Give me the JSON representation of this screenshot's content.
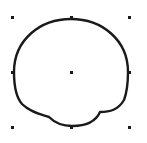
{
  "canvas": {
    "background": "#ffffff",
    "width": 147,
    "height": 143
  },
  "shape": {
    "kind": "scalloped-blob",
    "stroke": "#1a1a1a",
    "stroke_width": 2.4,
    "fill": "none",
    "selected": true
  },
  "selection": {
    "handle_color": "#1a1a1a",
    "bbox": {
      "left": 12,
      "top": 17,
      "right": 129,
      "bottom": 127
    },
    "handles": [
      {
        "name": "handle-top-left",
        "x": 12,
        "y": 17
      },
      {
        "name": "handle-top-middle",
        "x": 71,
        "y": 17
      },
      {
        "name": "handle-top-right",
        "x": 129,
        "y": 17
      },
      {
        "name": "handle-middle-left",
        "x": 12,
        "y": 72
      },
      {
        "name": "handle-center",
        "x": 71,
        "y": 72
      },
      {
        "name": "handle-middle-right",
        "x": 129,
        "y": 72
      },
      {
        "name": "handle-bottom-left",
        "x": 12,
        "y": 127
      },
      {
        "name": "handle-bottom-middle",
        "x": 71,
        "y": 127
      },
      {
        "name": "handle-bottom-right",
        "x": 129,
        "y": 127
      }
    ]
  }
}
